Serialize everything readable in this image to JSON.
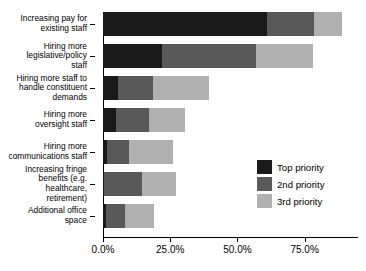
{
  "chart_data": {
    "type": "bar",
    "orientation": "horizontal",
    "stacked": true,
    "title": "",
    "xlabel": "",
    "ylabel": "",
    "xlim": [
      0,
      93
    ],
    "grid": false,
    "legend_position": "inside-right",
    "xticks": [
      "0.0%",
      "25.0%",
      "50.0%",
      "75.0%"
    ],
    "xtick_values": [
      0,
      25,
      50,
      75
    ],
    "categories": [
      "Increasing pay for\nexisting staff",
      "Hiring more\nlegislative/policy\nstaff",
      "Hiring more staff to\nhandle constituent\ndemands",
      "Hiring more\noversight staff",
      "Hiring more\ncommunications staff",
      "Increasing fringe\nbenefits (e.g.\nhealthcare,\nretirement)",
      "Additional office\nspace"
    ],
    "series": [
      {
        "name": "Top priority",
        "color": "#1a1a1a",
        "values": [
          61.0,
          22.0,
          5.5,
          5.0,
          1.5,
          0.5,
          1.0
        ]
      },
      {
        "name": "2nd priority",
        "color": "#595959",
        "values": [
          17.5,
          35.0,
          13.0,
          12.0,
          8.0,
          14.0,
          7.0
        ]
      },
      {
        "name": "3rd priority",
        "color": "#b0b0b0",
        "values": [
          10.5,
          21.0,
          21.0,
          13.5,
          16.5,
          12.5,
          11.0
        ]
      }
    ]
  },
  "legend": {
    "entries": [
      {
        "label": "Top priority",
        "color": "#1a1a1a"
      },
      {
        "label": "2nd priority",
        "color": "#595959"
      },
      {
        "label": "3rd priority",
        "color": "#b0b0b0"
      }
    ]
  }
}
